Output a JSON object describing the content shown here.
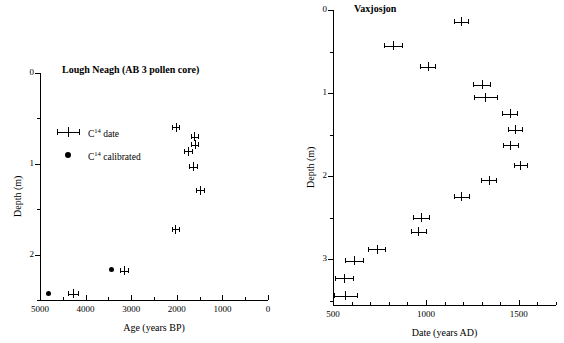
{
  "figure": {
    "background": "#ffffff",
    "marker_color": "#000000"
  },
  "chart_data": [
    {
      "type": "scatter",
      "title": "Lough Neagh (AB 3 pollen core)",
      "xlabel": "Age (years BP)",
      "ylabel": "Depth (m)",
      "xlim": [
        5000,
        0
      ],
      "ylim": [
        0,
        2.5
      ],
      "x_reversed": true,
      "y_reversed": true,
      "grid": false,
      "x_major_ticks": [
        5000,
        4000,
        3000,
        2000,
        1000,
        0
      ],
      "x_major_ticklabels": [
        "5000",
        "4000",
        "3000",
        "2000",
        "1000",
        "0"
      ],
      "x_minor_ticks": [
        4500,
        3500,
        2500,
        1500,
        500
      ],
      "y_major_ticks": [
        0,
        1,
        2
      ],
      "y_major_ticklabels": [
        "0",
        "1",
        "2"
      ],
      "y_minor_ticks": [
        0.5,
        1.5,
        2.5
      ],
      "legend_position": "upper left",
      "series": [
        {
          "name": "C14 date",
          "marker": "cross-errorbar",
          "points": [
            {
              "x": 2020,
              "y": 0.6,
              "xerr": 75
            },
            {
              "x": 1620,
              "y": 0.7,
              "xerr": 75
            },
            {
              "x": 1610,
              "y": 0.79,
              "xerr": 75
            },
            {
              "x": 1760,
              "y": 0.86,
              "xerr": 90
            },
            {
              "x": 1645,
              "y": 1.03,
              "xerr": 85
            },
            {
              "x": 1490,
              "y": 1.29,
              "xerr": 80
            },
            {
              "x": 2030,
              "y": 1.72,
              "xerr": 75
            },
            {
              "x": 3150,
              "y": 2.18,
              "xerr": 90
            },
            {
              "x": 4280,
              "y": 2.43,
              "xerr": 105
            }
          ]
        },
        {
          "name": "C14 calibrated",
          "marker": "filled-circle",
          "points": [
            {
              "x": 3420,
              "y": 2.17
            },
            {
              "x": 4800,
              "y": 2.43
            }
          ]
        }
      ]
    },
    {
      "type": "scatter",
      "title": "Vaxjosjon",
      "xlabel": "Date (years AD)",
      "ylabel": "Depth (m)",
      "xlim": [
        500,
        1700
      ],
      "ylim": [
        0,
        3.55
      ],
      "x_reversed": false,
      "y_reversed": true,
      "grid": false,
      "x_major_ticks": [
        500,
        1000,
        1500
      ],
      "x_major_ticklabels": [
        "500",
        "1000",
        "1500"
      ],
      "x_minor_ticks": [
        600,
        700,
        800,
        900,
        1100,
        1200,
        1300,
        1400,
        1600,
        1700
      ],
      "y_major_ticks": [
        0,
        1,
        2,
        3
      ],
      "y_major_ticklabels": [
        "0",
        "1",
        "2",
        "3"
      ],
      "y_minor_ticks": [
        0.5,
        1.5,
        2.5,
        3.5
      ],
      "series": [
        {
          "name": "C14 date",
          "marker": "cross-errorbar",
          "points": [
            {
              "x": 1187,
              "y": 0.14,
              "xerr": 38
            },
            {
              "x": 824,
              "y": 0.43,
              "xerr": 48
            },
            {
              "x": 1010,
              "y": 0.68,
              "xerr": 40
            },
            {
              "x": 1300,
              "y": 0.9,
              "xerr": 45
            },
            {
              "x": 1320,
              "y": 1.05,
              "xerr": 60
            },
            {
              "x": 1450,
              "y": 1.25,
              "xerr": 42
            },
            {
              "x": 1480,
              "y": 1.44,
              "xerr": 36
            },
            {
              "x": 1455,
              "y": 1.63,
              "xerr": 40
            },
            {
              "x": 1508,
              "y": 1.87,
              "xerr": 36
            },
            {
              "x": 1337,
              "y": 2.05,
              "xerr": 40
            },
            {
              "x": 1190,
              "y": 2.25,
              "xerr": 40
            },
            {
              "x": 975,
              "y": 2.5,
              "xerr": 42
            },
            {
              "x": 960,
              "y": 2.67,
              "xerr": 42
            },
            {
              "x": 735,
              "y": 2.88,
              "xerr": 45
            },
            {
              "x": 612,
              "y": 3.02,
              "xerr": 48
            },
            {
              "x": 560,
              "y": 3.23,
              "xerr": 50
            },
            {
              "x": 565,
              "y": 3.44,
              "xerr": 62
            }
          ]
        }
      ]
    }
  ],
  "left_panel": {
    "title": "Lough Neagh (AB 3 pollen core)",
    "xlabel": "Age (years BP)",
    "ylabel": "Depth (m)",
    "legend": {
      "date_label_base": "C",
      "date_label_sup": "14",
      "date_label_rest": " date",
      "calibrated_label_rest": " calibrated"
    }
  },
  "right_panel": {
    "title": "Vaxjosjon",
    "xlabel": "Date (years AD)",
    "ylabel": "Depth (m)"
  }
}
